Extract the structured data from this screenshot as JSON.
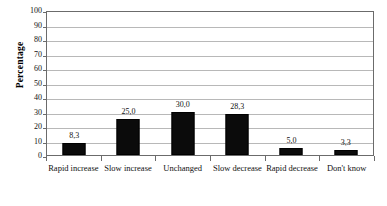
{
  "chart_data": {
    "type": "bar",
    "title": "",
    "xlabel": "",
    "ylabel": "Percentage",
    "ylim": [
      0,
      100
    ],
    "ytick_step": 10,
    "grid": true,
    "legend": "none",
    "decimal_separator": ",",
    "categories": [
      "Rapid increase",
      "Slow increase",
      "Unchanged",
      "Slow decrease",
      "Rapid decrease",
      "Don't know"
    ],
    "values": [
      8.3,
      25.0,
      30.0,
      28.3,
      5.0,
      3.3
    ],
    "data_labels": [
      "8,3",
      "25,0",
      "30,0",
      "28,3",
      "5,0",
      "3,3"
    ],
    "ytick_labels": [
      "100",
      "90",
      "80",
      "70",
      "60",
      "50",
      "40",
      "30",
      "20",
      "10",
      "0"
    ],
    "colors": {
      "bar_fill": "#0b0b0b",
      "bar_border": "#000000",
      "gridline": "#b8b8b8",
      "axis": "#6b6b6b",
      "text": "#111111",
      "background": "#ffffff"
    }
  }
}
